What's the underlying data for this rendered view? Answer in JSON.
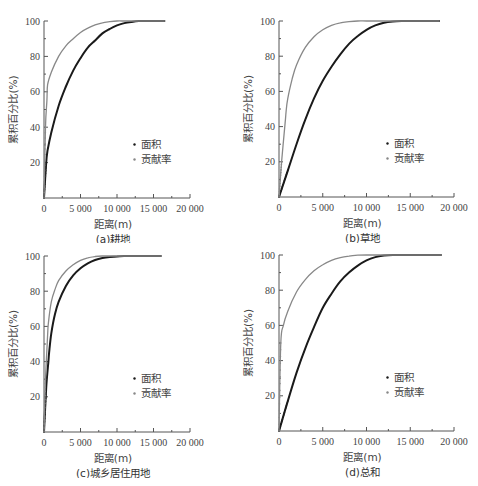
{
  "chart_data": [
    {
      "type": "line",
      "title": "(a)耕地",
      "xlabel": "距离(m)",
      "ylabel": "累积百分比(%)",
      "xlim": [
        0,
        20000
      ],
      "ylim": [
        0,
        100
      ],
      "xticks": [
        "0",
        "5 000",
        "10 000",
        "15 000",
        "20 000"
      ],
      "yticks": [
        "20",
        "40",
        "60",
        "80",
        "100"
      ],
      "grid": false,
      "legend": {
        "position": "lower right",
        "entries": [
          "面积",
          "贡献率"
        ]
      },
      "series": [
        {
          "name": "面积",
          "color": "#1a1a1a",
          "x": [
            0,
            300,
            500,
            1000,
            2000,
            3000,
            4000,
            5000,
            6000,
            7000,
            8000,
            9000,
            10000,
            11000,
            12000,
            13000,
            14000,
            15000,
            16500
          ],
          "y": [
            0,
            20,
            27,
            37,
            52,
            63,
            72,
            79,
            85,
            89,
            93,
            95.5,
            97.5,
            98.8,
            99.5,
            100,
            100,
            100,
            100
          ]
        },
        {
          "name": "贡献率",
          "color": "#888888",
          "x": [
            0,
            200,
            400,
            500,
            1000,
            2000,
            3000,
            4000,
            5000,
            6000,
            7000,
            8000,
            9000,
            10000,
            11000,
            12000,
            14000,
            16500
          ],
          "y": [
            0,
            40,
            55,
            64,
            71,
            80,
            86,
            90,
            93.5,
            96,
            97.8,
            99,
            99.6,
            100,
            100,
            100,
            100,
            100
          ]
        }
      ]
    },
    {
      "type": "line",
      "title": "(b)草地",
      "xlabel": "距离(m)",
      "ylabel": "累积百分比(%)",
      "xlim": [
        0,
        20000
      ],
      "ylim": [
        0,
        100
      ],
      "xticks": [
        "0",
        "5 000",
        "10 000",
        "15 000",
        "20 000"
      ],
      "yticks": [
        "20",
        "40",
        "60",
        "80",
        "100"
      ],
      "grid": false,
      "legend": {
        "position": "lower right",
        "entries": [
          "面积",
          "贡献率"
        ]
      },
      "series": [
        {
          "name": "面积",
          "color": "#1a1a1a",
          "x": [
            0,
            1000,
            2000,
            3000,
            4000,
            5000,
            6000,
            7000,
            8000,
            9000,
            10000,
            11000,
            12000,
            13000,
            14000,
            15000,
            18300
          ],
          "y": [
            0,
            15,
            30,
            44,
            56,
            66,
            74,
            81,
            87,
            91.5,
            95,
            97.5,
            99,
            99.7,
            100,
            100,
            100
          ]
        },
        {
          "name": "贡献率",
          "color": "#888888",
          "x": [
            0,
            300,
            700,
            800,
            1000,
            1500,
            2000,
            3000,
            4000,
            5000,
            6000,
            7000,
            8000,
            9000,
            10000,
            12000,
            18300
          ],
          "y": [
            0,
            20,
            42,
            48,
            56,
            67,
            75,
            85,
            91,
            95,
            97.5,
            99,
            99.6,
            100,
            100,
            100,
            100
          ]
        }
      ]
    },
    {
      "type": "line",
      "title": "(c)城乡居住用地",
      "xlabel": "距离(m)",
      "ylabel": "累积百分比(%)",
      "xlim": [
        0,
        20000
      ],
      "ylim": [
        0,
        100
      ],
      "xticks": [
        "0",
        "5 000",
        "10 000",
        "15 000",
        "20 000"
      ],
      "yticks": [
        "20",
        "40",
        "60",
        "80",
        "100"
      ],
      "grid": false,
      "legend": {
        "position": "lower right",
        "entries": [
          "面积",
          "贡献率"
        ]
      },
      "series": [
        {
          "name": "面积",
          "color": "#1a1a1a",
          "x": [
            0,
            300,
            600,
            700,
            1000,
            1500,
            2000,
            3000,
            4000,
            5000,
            6000,
            7000,
            8000,
            9000,
            10000,
            11000,
            12000,
            16000
          ],
          "y": [
            0,
            25,
            40,
            45,
            56,
            67,
            74,
            83,
            89,
            93,
            95.8,
            97.7,
            98.8,
            99.4,
            99.8,
            100,
            100,
            100
          ]
        },
        {
          "name": "贡献率",
          "color": "#888888",
          "x": [
            0,
            200,
            500,
            600,
            1000,
            1500,
            2000,
            3000,
            4000,
            5000,
            6000,
            7000,
            8000,
            9000,
            16000
          ],
          "y": [
            0,
            30,
            55,
            62,
            74,
            81,
            86,
            91.5,
            95,
            97.5,
            99,
            99.7,
            100,
            100,
            100
          ]
        }
      ]
    },
    {
      "type": "line",
      "title": "(d)总和",
      "xlabel": "距离(m)",
      "ylabel": "累积百分比(%)",
      "xlim": [
        0,
        20000
      ],
      "ylim": [
        0,
        100
      ],
      "xticks": [
        "0",
        "5 000",
        "10 000",
        "15 000",
        "20 000"
      ],
      "yticks": [
        "20",
        "40",
        "60",
        "80",
        "100"
      ],
      "grid": false,
      "legend": {
        "position": "lower right",
        "entries": [
          "面积",
          "贡献率"
        ]
      },
      "series": [
        {
          "name": "面积",
          "color": "#1a1a1a",
          "x": [
            0,
            1000,
            2000,
            3000,
            4000,
            5000,
            6000,
            7000,
            8000,
            9000,
            10000,
            11000,
            12000,
            13000,
            15000,
            18500
          ],
          "y": [
            0,
            17,
            33,
            47,
            59,
            70,
            78,
            85,
            90,
            94,
            97,
            98.8,
            99.7,
            100,
            100,
            100
          ]
        },
        {
          "name": "贡献率",
          "color": "#888888",
          "x": [
            0,
            200,
            500,
            1000,
            2000,
            3000,
            4000,
            5000,
            6000,
            7000,
            8000,
            9000,
            10000,
            12000,
            18500
          ],
          "y": [
            0,
            50,
            60,
            68,
            79,
            86,
            91,
            94.5,
            97,
            98.5,
            99.4,
            99.9,
            100,
            100,
            100
          ]
        }
      ]
    }
  ],
  "panels": [
    {
      "caption": "(a)耕地",
      "xlabel": "距离(m)",
      "ylabel": "累积百分比(%)",
      "legend": [
        "面积",
        "贡献率"
      ]
    },
    {
      "caption": "(b)草地",
      "xlabel": "距离(m)",
      "ylabel": "累积百分比(%)",
      "legend": [
        "面积",
        "贡献率"
      ]
    },
    {
      "caption": "(c)城乡居住用地",
      "xlabel": "距离(m)",
      "ylabel": "累积百分比(%)",
      "legend": [
        "面积",
        "贡献率"
      ]
    },
    {
      "caption": "(d)总和",
      "xlabel": "距离(m)",
      "ylabel": "累积百分比(%)",
      "legend": [
        "面积",
        "贡献率"
      ]
    }
  ],
  "ticks": {
    "x": [
      "0",
      "5 000",
      "10 000",
      "15 000",
      "20 000"
    ],
    "y": [
      "20",
      "40",
      "60",
      "80",
      "100"
    ]
  }
}
